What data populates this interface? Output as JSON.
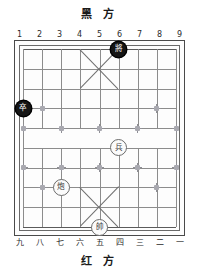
{
  "board": {
    "title_top": "黑  方",
    "title_bottom": "红  方",
    "files_top": [
      "1",
      "2",
      "3",
      "4",
      "5",
      "6",
      "7",
      "8",
      "9"
    ],
    "files_bottom": [
      "九",
      "八",
      "七",
      "六",
      "五",
      "四",
      "三",
      "二",
      "一"
    ],
    "colors": {
      "black_piece_fill": "#151515",
      "black_piece_text": "#ffffff",
      "red_piece_fill": "#fbfbfb",
      "red_piece_text": "#3a3a3a",
      "grid_line": "#8c8c8c",
      "frame": "#4a4a4a",
      "marker": "#8f8f96",
      "background": "#ffffff"
    },
    "grid": {
      "files": 9,
      "ranks": 10,
      "river_between_ranks": [
        5,
        6
      ],
      "palace_top_files": [
        4,
        6
      ],
      "palace_bottom_files": [
        4,
        6
      ]
    },
    "pieces": [
      {
        "id": "black-general",
        "glyph": "將",
        "side": "black",
        "file": 6,
        "rank": 1
      },
      {
        "id": "black-pawn",
        "glyph": "卒",
        "side": "black",
        "file": 1,
        "rank": 4
      },
      {
        "id": "red-pawn",
        "glyph": "兵",
        "side": "red",
        "file": 6,
        "rank": 6
      },
      {
        "id": "red-cannon",
        "glyph": "炮",
        "side": "red",
        "file": 3,
        "rank": 8
      },
      {
        "id": "red-general",
        "glyph": "帥",
        "side": "red",
        "file": 5,
        "rank": 10
      }
    ],
    "markers": [
      {
        "file": 2,
        "rank": 4,
        "style": "full"
      },
      {
        "file": 8,
        "rank": 4,
        "style": "full"
      },
      {
        "file": 1,
        "rank": 5,
        "style": "half-l"
      },
      {
        "file": 3,
        "rank": 5,
        "style": "full"
      },
      {
        "file": 5,
        "rank": 5,
        "style": "full"
      },
      {
        "file": 7,
        "rank": 5,
        "style": "full"
      },
      {
        "file": 9,
        "rank": 5,
        "style": "half-r"
      },
      {
        "file": 1,
        "rank": 7,
        "style": "half-l"
      },
      {
        "file": 3,
        "rank": 7,
        "style": "full"
      },
      {
        "file": 5,
        "rank": 7,
        "style": "full"
      },
      {
        "file": 7,
        "rank": 7,
        "style": "full"
      },
      {
        "file": 9,
        "rank": 7,
        "style": "half-r"
      },
      {
        "file": 2,
        "rank": 8,
        "style": "full"
      },
      {
        "file": 8,
        "rank": 8,
        "style": "full"
      }
    ]
  }
}
